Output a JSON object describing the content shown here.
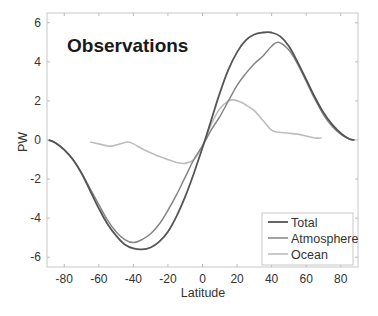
{
  "chart_data": {
    "type": "line",
    "title": "Observations",
    "xlabel": "Latitude",
    "ylabel": "PW",
    "xlim": [
      -90,
      90
    ],
    "ylim": [
      -6.5,
      6.5
    ],
    "xticks": [
      -80,
      -60,
      -40,
      -20,
      0,
      20,
      40,
      60,
      80
    ],
    "yticks": [
      -6,
      -4,
      -2,
      0,
      2,
      4,
      6
    ],
    "grid": false,
    "legend_position": "lower right",
    "series": [
      {
        "name": "Total",
        "color": "#555555",
        "x": [
          -89,
          -85,
          -80,
          -75,
          -70,
          -65,
          -60,
          -55,
          -50,
          -45,
          -40,
          -35,
          -30,
          -25,
          -20,
          -15,
          -10,
          -5,
          0,
          5,
          10,
          15,
          20,
          25,
          30,
          35,
          40,
          45,
          50,
          55,
          60,
          65,
          70,
          75,
          80,
          85,
          88
        ],
        "y": [
          0,
          -0.15,
          -0.5,
          -1.0,
          -1.7,
          -2.6,
          -3.5,
          -4.3,
          -4.9,
          -5.35,
          -5.55,
          -5.6,
          -5.5,
          -5.2,
          -4.7,
          -3.9,
          -2.9,
          -1.7,
          -0.4,
          1.0,
          2.4,
          3.6,
          4.5,
          5.1,
          5.4,
          5.5,
          5.5,
          5.3,
          4.8,
          4.0,
          3.1,
          2.2,
          1.4,
          0.8,
          0.35,
          0.05,
          0
        ]
      },
      {
        "name": "Atmosphere",
        "color": "#858585",
        "x": [
          -89,
          -85,
          -80,
          -75,
          -70,
          -65,
          -60,
          -55,
          -50,
          -45,
          -40,
          -35,
          -30,
          -25,
          -20,
          -15,
          -10,
          -5,
          0,
          5,
          10,
          15,
          20,
          25,
          30,
          35,
          40,
          44,
          50,
          55,
          60,
          65,
          70,
          75,
          80,
          85,
          88
        ],
        "y": [
          0,
          -0.15,
          -0.5,
          -1.0,
          -1.7,
          -2.5,
          -3.3,
          -4.1,
          -4.7,
          -5.1,
          -5.25,
          -5.1,
          -4.8,
          -4.3,
          -3.6,
          -2.8,
          -1.9,
          -1.0,
          -0.3,
          0.5,
          1.2,
          2.0,
          2.8,
          3.4,
          3.9,
          4.3,
          4.8,
          5.0,
          4.6,
          3.9,
          3.0,
          2.1,
          1.3,
          0.7,
          0.3,
          0.05,
          0
        ]
      },
      {
        "name": "Ocean",
        "color": "#bdbdbd",
        "x": [
          -65,
          -60,
          -55,
          -52,
          -48,
          -43,
          -40,
          -35,
          -30,
          -25,
          -20,
          -15,
          -10,
          -5,
          0,
          5,
          10,
          15,
          18,
          22,
          26,
          30,
          35,
          40,
          44,
          50,
          55,
          60,
          65,
          69
        ],
        "y": [
          -0.1,
          -0.2,
          -0.3,
          -0.3,
          -0.2,
          -0.1,
          -0.2,
          -0.45,
          -0.65,
          -0.85,
          -1.0,
          -1.15,
          -1.2,
          -1.0,
          -0.3,
          0.8,
          1.6,
          2.0,
          2.05,
          1.95,
          1.75,
          1.5,
          1.0,
          0.5,
          0.4,
          0.35,
          0.3,
          0.2,
          0.1,
          0.1
        ]
      }
    ]
  }
}
